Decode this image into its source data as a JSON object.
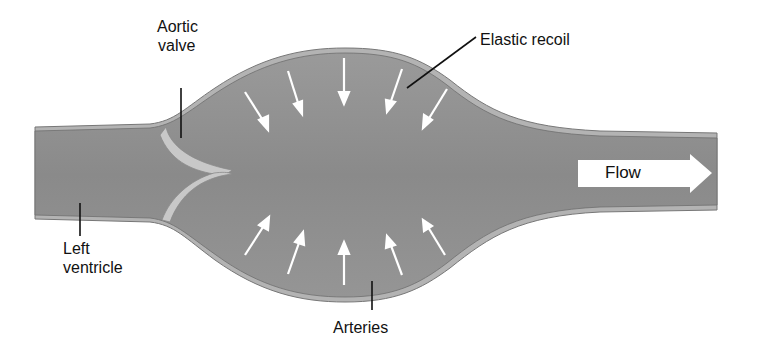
{
  "labels": {
    "aortic_valve_line1": "Aortic",
    "aortic_valve_line2": "valve",
    "elastic_recoil": "Elastic recoil",
    "left_ventricle_line1": "Left",
    "left_ventricle_line2": "ventricle",
    "arteries": "Arteries",
    "flow": "Flow"
  },
  "colors": {
    "vessel_fill": "#8c8c8c",
    "vessel_wall": "#b4b4b4",
    "wall_outline": "#6e6e6e",
    "valve": "#c4c4c4",
    "arrows": "#ffffff",
    "leader_lines": "#111111"
  },
  "arrows": {
    "direction_top": "inward-down",
    "direction_bottom": "inward-up",
    "count_top": 6,
    "count_bottom": 6
  }
}
